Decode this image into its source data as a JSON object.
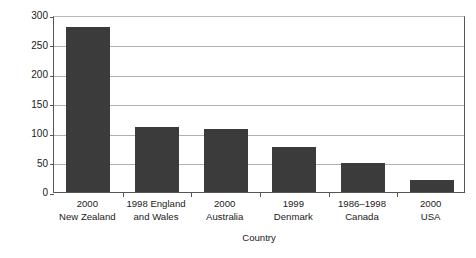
{
  "chart_data": {
    "type": "bar",
    "title": "",
    "xlabel": "Country",
    "ylabel": "Rate /100,000",
    "ylim": [
      0,
      300
    ],
    "ytick_values": [
      0,
      50,
      100,
      150,
      200,
      250,
      300
    ],
    "ytick_labels": [
      "0",
      "50",
      "100",
      "150",
      "200",
      "250",
      "300"
    ],
    "grid": true,
    "legend": "none",
    "bar_color": "#3b3b3b",
    "gridline_color": "#b0b0b0",
    "axis_color": "#555555",
    "categories": [
      "2000 New Zealand",
      "1998 England and Wales",
      "2000 Australia",
      "1999 Denmark",
      "1986–1998 Canada",
      "2000 USA"
    ],
    "category_lines": [
      {
        "line1": "2000",
        "line2": "New Zealand"
      },
      {
        "line1": "1998 England",
        "line2": "and Wales"
      },
      {
        "line1": "2000",
        "line2": "Australia"
      },
      {
        "line1": "1999",
        "line2": "Denmark"
      },
      {
        "line1": "1986–1998",
        "line2": "Canada"
      },
      {
        "line1": "2000",
        "line2": "USA"
      }
    ],
    "values": [
      280,
      111,
      107,
      77,
      50,
      20
    ]
  }
}
